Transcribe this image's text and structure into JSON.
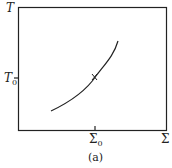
{
  "figure": {
    "y_axis_label": "T",
    "y_tick_label": "T",
    "y_tick_sub": "0",
    "x_tick_label": "Σ",
    "x_tick_sub": "0",
    "x_axis_label": "Σ",
    "caption": "(a)",
    "line_color": "#222222"
  }
}
